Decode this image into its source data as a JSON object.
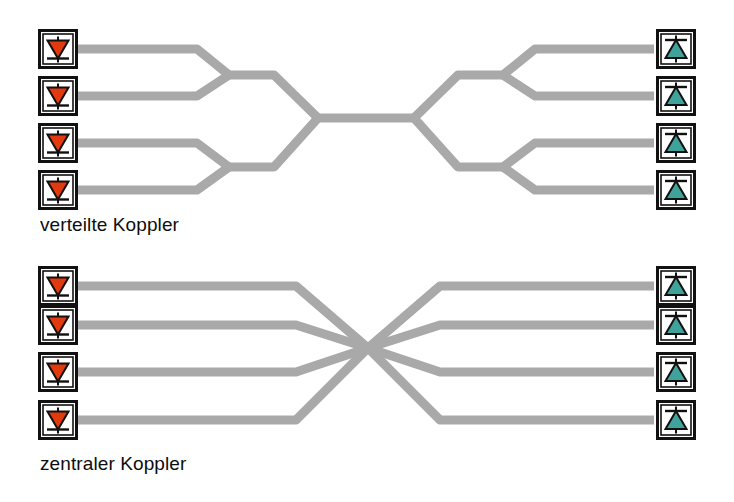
{
  "figure": {
    "background_color": "#ffffff",
    "width": 734,
    "height": 502
  },
  "colors": {
    "waveguide": "#a9a9a9",
    "waveguide_edge": "#9a9a9a",
    "transmitter_fill": "#e2390f",
    "transmitter_fill_light": "#f05a23",
    "receiver_fill": "#3fa39b",
    "receiver_fill_light": "#62bdb4",
    "icon_border": "#111111",
    "icon_background": "#ffffff",
    "text": "#0d0d0d"
  },
  "diagrams": [
    {
      "id": "verteilte-koppler",
      "caption": "verteilte Koppler",
      "topology": "distributed-tree",
      "description": "Binärbaum aus verteilten 2x2 Kopplern",
      "transmitter_count": 4,
      "receiver_count": 4,
      "coupler_stages": 2
    },
    {
      "id": "zentraler-koppler",
      "caption": "zentraler Koppler",
      "topology": "central-star",
      "description": "Sternkoppler mit zentralem Mischpunkt",
      "transmitter_count": 4,
      "receiver_count": 4,
      "coupler_stages": 1
    }
  ],
  "icons": {
    "transmitter": {
      "name": "laser-diode-transmitter-icon",
      "symbol": "down-triangle-diode",
      "direction": "down",
      "role": "Sender"
    },
    "receiver": {
      "name": "photo-diode-receiver-icon",
      "symbol": "up-triangle-diode",
      "direction": "up",
      "role": "Empfänger"
    }
  },
  "nodes": {
    "top_transmitters": [
      {
        "label": "Sender 1"
      },
      {
        "label": "Sender 2"
      },
      {
        "label": "Sender 3"
      },
      {
        "label": "Sender 4"
      }
    ],
    "top_receivers": [
      {
        "label": "Empfänger 1"
      },
      {
        "label": "Empfänger 2"
      },
      {
        "label": "Empfänger 3"
      },
      {
        "label": "Empfänger 4"
      }
    ],
    "bottom_transmitters": [
      {
        "label": "Sender 1"
      },
      {
        "label": "Sender 2"
      },
      {
        "label": "Sender 3"
      },
      {
        "label": "Sender 4"
      }
    ],
    "bottom_receivers": [
      {
        "label": "Empfänger 1"
      },
      {
        "label": "Empfänger 2"
      },
      {
        "label": "Empfänger 3"
      },
      {
        "label": "Empfänger 4"
      }
    ]
  }
}
